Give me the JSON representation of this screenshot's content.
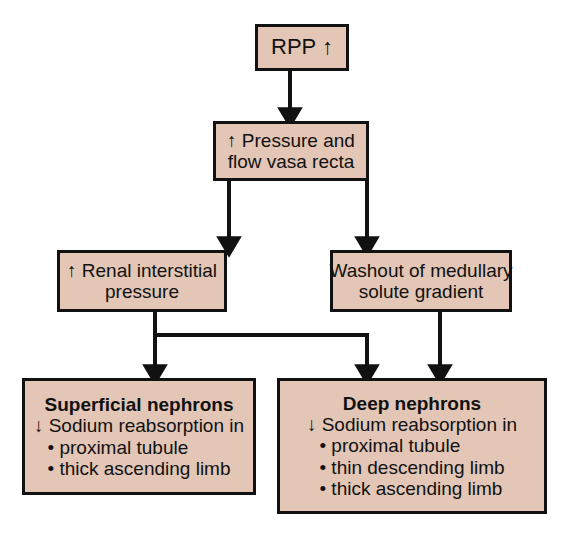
{
  "diagram": {
    "type": "flowchart",
    "background_color": "#ffffff",
    "box_fill_color": "#e3c6b5",
    "box_border_color": "#111111",
    "text_color": "#111111",
    "nodes": {
      "rpp": {
        "label": "RPP ↑",
        "lines": [
          "RPP ↑"
        ]
      },
      "vasa_recta": {
        "label": "↑ Pressure and flow vasa recta",
        "lines": [
          "↑ Pressure and",
          "flow vasa recta"
        ]
      },
      "interstitial": {
        "label": "↑ Renal interstitial pressure",
        "lines": [
          "↑ Renal interstitial",
          "pressure"
        ]
      },
      "washout": {
        "label": "Washout of medullary solute gradient",
        "lines": [
          "Washout of medullary",
          "solute gradient"
        ]
      },
      "superficial": {
        "heading": "Superficial nephrons",
        "subheading": "↓ Sodium reabsorption in",
        "bullets": [
          "• proximal tubule",
          "• thick ascending limb"
        ]
      },
      "deep": {
        "heading": "Deep nephrons",
        "subheading": "↓ Sodium reabsorption in",
        "bullets": [
          "• proximal tubule",
          "• thin descending limb",
          "• thick ascending limb"
        ]
      }
    },
    "edges": [
      {
        "name": "rpp-to-vasa",
        "from": "rpp",
        "to": "vasa_recta"
      },
      {
        "name": "vasa-to-interstitial",
        "from": "vasa_recta",
        "to": "interstitial"
      },
      {
        "name": "vasa-to-washout",
        "from": "vasa_recta",
        "to": "washout"
      },
      {
        "name": "interstitial-to-superficial",
        "from": "interstitial",
        "to": "superficial"
      },
      {
        "name": "interstitial-to-deep",
        "from": "interstitial",
        "to": "deep"
      },
      {
        "name": "washout-to-deep",
        "from": "washout",
        "to": "deep"
      }
    ]
  }
}
